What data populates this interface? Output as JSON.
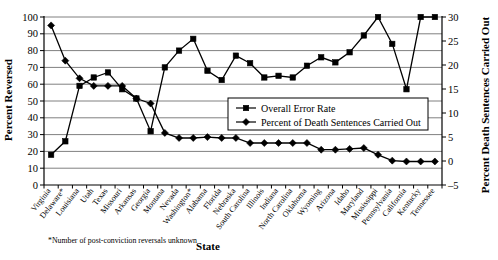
{
  "chart_data": {
    "type": "line",
    "title": "",
    "xlabel": "State",
    "ylabel": "Percent Reversed",
    "y2label": "Percent Death Sentences Carried Out",
    "footnote": "*Number of post-conviction reversals unknown",
    "grid": true,
    "legend_position": "center-right-inside",
    "ylim": [
      0,
      100
    ],
    "yticks": [
      0,
      10,
      20,
      30,
      40,
      50,
      60,
      70,
      80,
      90,
      100
    ],
    "y2lim": [
      -5,
      30
    ],
    "y2ticks": [
      -5,
      0,
      5,
      10,
      15,
      20,
      25,
      30
    ],
    "categories": [
      "Virginia",
      "Delaware*",
      "Louisiana",
      "Utah",
      "Texas",
      "Missouri",
      "Arkansas",
      "Georgia",
      "Montana",
      "Nevada",
      "Washington*",
      "Alabama",
      "Florida",
      "Nebraska",
      "South Carolina",
      "Illinois",
      "Indiana",
      "North Carolina",
      "Oklahoma",
      "Wyoming",
      "Arizona",
      "Idaho",
      "Maryland",
      "Mississippi",
      "Pennsylvania",
      "California",
      "Kentucky",
      "Tennessee"
    ],
    "series": [
      {
        "name": "Overall Error Rate",
        "axis": "left",
        "marker": "square",
        "values": [
          18,
          26,
          59,
          64,
          67,
          57,
          51.5,
          32,
          70,
          80,
          87,
          68,
          62.5,
          77,
          72.5,
          64,
          65,
          64,
          71,
          76,
          73,
          79,
          89,
          100,
          84,
          57,
          100,
          100
        ]
      },
      {
        "name": "Percent of Death Sentences Carried Out",
        "axis": "right",
        "marker": "diamond",
        "values": [
          28.3,
          20.9,
          15.8,
          15.8,
          15.8,
          15.8,
          13.0,
          12.0,
          5.9,
          4.8,
          4.5,
          4.5,
          4.3,
          4.3,
          3.6,
          3.6,
          3.6,
          3.6,
          3.6,
          2.2,
          2.2,
          2.2,
          2.4,
          1.0,
          0.2,
          0.1,
          0.1,
          0.1
        ]
      }
    ],
    "series_left_values_percent_reversed": [
      18,
      26,
      59,
      64,
      67,
      57,
      51.5,
      32,
      70,
      80,
      87,
      68,
      62.5,
      77,
      72.5,
      64,
      65,
      64,
      71,
      76,
      73,
      79,
      89,
      100,
      84,
      57,
      100,
      100
    ],
    "series_right_values_diamond_on_left_scale": [
      95,
      74,
      63.5,
      59,
      59,
      59,
      51.5,
      48.5,
      31,
      28,
      28,
      28.5,
      28,
      28,
      25,
      25,
      25,
      25,
      25,
      21,
      21,
      21.5,
      22,
      18,
      14.5,
      14,
      14,
      14
    ]
  },
  "legend": {
    "items": [
      {
        "label": "Overall Error Rate",
        "marker": "square"
      },
      {
        "label": "Percent of Death Sentences Carried Out",
        "marker": "diamond"
      }
    ]
  }
}
